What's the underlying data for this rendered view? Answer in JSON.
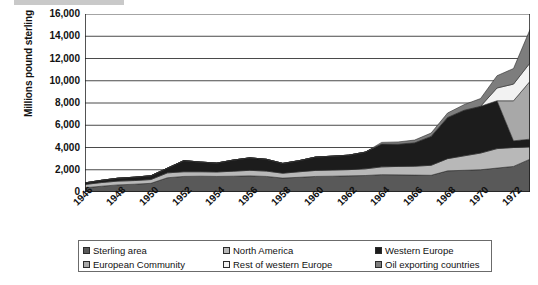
{
  "chart_data": {
    "type": "area",
    "stacked": true,
    "title": "",
    "subtitle": "",
    "xlabel": "",
    "ylabel": "Millions pound sterling",
    "ylim": [
      0,
      16000
    ],
    "ytick_labels": [
      "0",
      "2,000",
      "4,000",
      "6,000",
      "8,000",
      "10,000",
      "12,000",
      "14,000",
      "16,000"
    ],
    "ytick_values": [
      0,
      2000,
      4000,
      6000,
      8000,
      10000,
      12000,
      14000,
      16000
    ],
    "grid": true,
    "legend_position": "bottom",
    "x": [
      1946,
      1947,
      1948,
      1949,
      1950,
      1951,
      1952,
      1953,
      1954,
      1955,
      1956,
      1957,
      1958,
      1959,
      1960,
      1961,
      1962,
      1963,
      1964,
      1965,
      1966,
      1967,
      1968,
      1969,
      1970,
      1971,
      1972,
      1973
    ],
    "xtick_labels": [
      "1946",
      "1948",
      "1950",
      "1952",
      "1954",
      "1956",
      "1958",
      "1960",
      "1962",
      "1964",
      "1966",
      "1968",
      "1970",
      "1972"
    ],
    "xtick_values": [
      1946,
      1948,
      1950,
      1952,
      1954,
      1956,
      1958,
      1960,
      1962,
      1964,
      1966,
      1968,
      1970,
      1972
    ],
    "series": [
      {
        "name": "Sterling area",
        "color": "#595959",
        "values": [
          380,
          520,
          640,
          700,
          780,
          1280,
          1400,
          1420,
          1400,
          1420,
          1450,
          1400,
          1250,
          1320,
          1400,
          1420,
          1450,
          1480,
          1560,
          1540,
          1520,
          1500,
          1900,
          1950,
          2000,
          2150,
          2300,
          2950
        ]
      },
      {
        "name": "North America",
        "color": "#b8b8b8",
        "values": [
          300,
          330,
          340,
          330,
          340,
          440,
          420,
          400,
          400,
          450,
          500,
          480,
          440,
          500,
          540,
          550,
          560,
          600,
          700,
          760,
          800,
          900,
          1100,
          1300,
          1500,
          1750,
          1700,
          1100
        ]
      },
      {
        "name": "Western Europe",
        "color": "#1c1c1c",
        "values": [
          140,
          200,
          260,
          300,
          340,
          420,
          1000,
          870,
          800,
          1000,
          1120,
          1060,
          880,
          1000,
          1200,
          1250,
          1300,
          1500,
          2050,
          2000,
          2100,
          2600,
          3700,
          4100,
          4200,
          4300,
          600,
          700
        ]
      },
      {
        "name": "European Community",
        "color": "#a8a8a8",
        "values": [
          0,
          0,
          0,
          0,
          0,
          0,
          0,
          0,
          0,
          0,
          0,
          0,
          0,
          0,
          0,
          0,
          0,
          0,
          0,
          0,
          0,
          0,
          0,
          0,
          0,
          0,
          3600,
          5200
        ]
      },
      {
        "name": "Rest of western Europe",
        "color": "#f2f2f2",
        "values": [
          0,
          0,
          0,
          0,
          0,
          0,
          0,
          0,
          0,
          0,
          0,
          0,
          0,
          0,
          0,
          0,
          0,
          0,
          0,
          0,
          0,
          0,
          0,
          0,
          0,
          1150,
          1500,
          1650
        ]
      },
      {
        "name": "Oil exporting countries",
        "color": "#7d7d7d",
        "values": [
          0,
          0,
          0,
          0,
          0,
          0,
          0,
          0,
          0,
          0,
          0,
          0,
          0,
          0,
          0,
          0,
          0,
          0,
          150,
          200,
          250,
          300,
          400,
          500,
          700,
          1100,
          1400,
          3000
        ]
      }
    ]
  },
  "legend": {
    "items": [
      {
        "label": "Sterling area",
        "color": "#595959"
      },
      {
        "label": "North America",
        "color": "#b8b8b8"
      },
      {
        "label": "Western Europe",
        "color": "#1c1c1c"
      },
      {
        "label": "European Community",
        "color": "#a8a8a8"
      },
      {
        "label": "Rest of western Europe",
        "color": "#f2f2f2"
      },
      {
        "label": "Oil exporting countries",
        "color": "#7d7d7d"
      }
    ]
  }
}
